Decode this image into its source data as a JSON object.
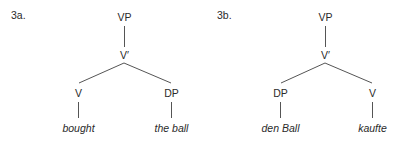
{
  "trees": [
    {
      "example_label": "3a.",
      "root": "VP",
      "bar": "V′",
      "left": {
        "label": "V",
        "word": "bought"
      },
      "right": {
        "label": "DP",
        "word": "the ball"
      }
    },
    {
      "example_label": "3b.",
      "root": "VP",
      "bar": "V′",
      "left": {
        "label": "DP",
        "word": "den Ball"
      },
      "right": {
        "label": "V",
        "word": "kaufte"
      }
    }
  ],
  "colors": {
    "text": "#2a2a2a",
    "line": "#555555"
  }
}
